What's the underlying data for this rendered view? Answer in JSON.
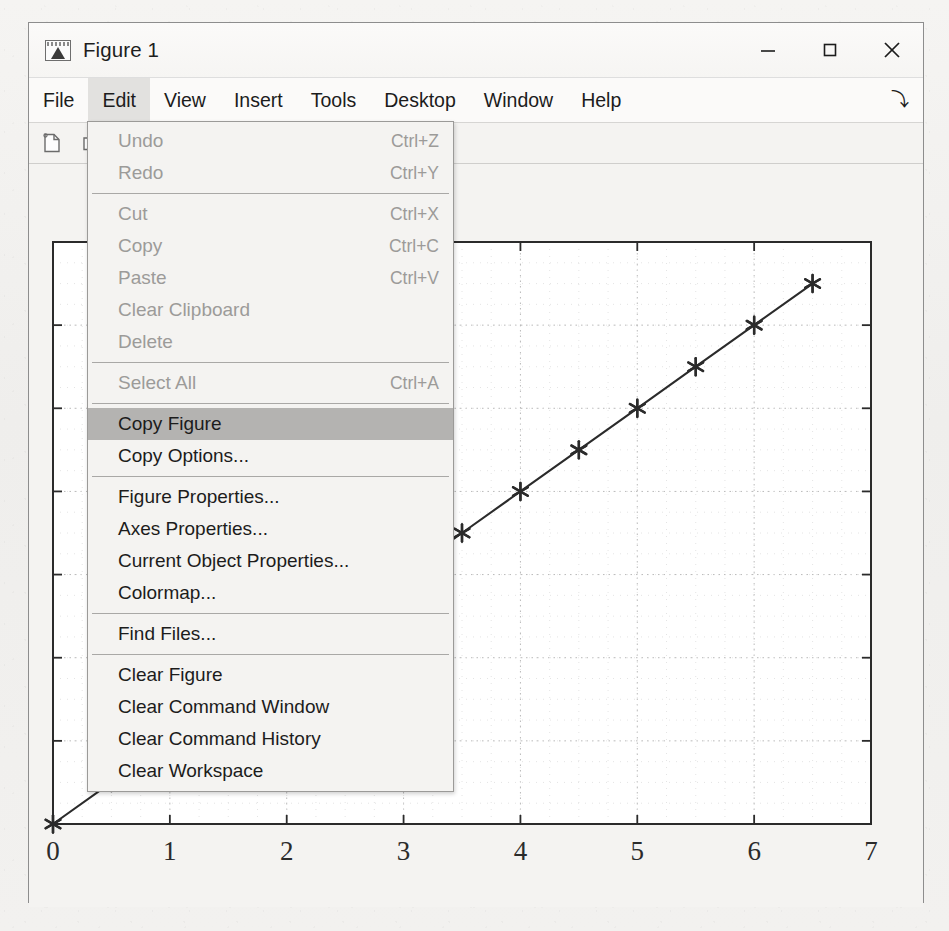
{
  "window": {
    "title": "Figure 1",
    "app_icon": "matlab-figure-icon",
    "controls": {
      "minimize_label": "–",
      "maximize_label": "□",
      "close_label": "✕"
    }
  },
  "menubar": {
    "items": [
      {
        "label": "File",
        "active": false
      },
      {
        "label": "Edit",
        "active": true
      },
      {
        "label": "View",
        "active": false
      },
      {
        "label": "Insert",
        "active": false
      },
      {
        "label": "Tools",
        "active": false
      },
      {
        "label": "Desktop",
        "active": false
      },
      {
        "label": "Window",
        "active": false
      },
      {
        "label": "Help",
        "active": false
      }
    ],
    "overflow_glyph": "⤵"
  },
  "toolbar": {
    "buttons": [
      {
        "icon": "new-figure-icon",
        "label": "New Figure"
      },
      {
        "icon": "open-file-icon",
        "label": "Open File"
      }
    ]
  },
  "edit_menu": {
    "rows": [
      {
        "type": "item",
        "label": "Undo",
        "accel": "Ctrl+Z",
        "disabled": true,
        "highlight": false
      },
      {
        "type": "item",
        "label": "Redo",
        "accel": "Ctrl+Y",
        "disabled": true,
        "highlight": false
      },
      {
        "type": "separator"
      },
      {
        "type": "item",
        "label": "Cut",
        "accel": "Ctrl+X",
        "disabled": true,
        "highlight": false
      },
      {
        "type": "item",
        "label": "Copy",
        "accel": "Ctrl+C",
        "disabled": true,
        "highlight": false
      },
      {
        "type": "item",
        "label": "Paste",
        "accel": "Ctrl+V",
        "disabled": true,
        "highlight": false
      },
      {
        "type": "item",
        "label": "Clear Clipboard",
        "accel": "",
        "disabled": true,
        "highlight": false
      },
      {
        "type": "item",
        "label": "Delete",
        "accel": "",
        "disabled": true,
        "highlight": false
      },
      {
        "type": "separator"
      },
      {
        "type": "item",
        "label": "Select All",
        "accel": "Ctrl+A",
        "disabled": true,
        "highlight": false
      },
      {
        "type": "separator"
      },
      {
        "type": "item",
        "label": "Copy Figure",
        "accel": "",
        "disabled": false,
        "highlight": true
      },
      {
        "type": "item",
        "label": "Copy Options...",
        "accel": "",
        "disabled": false,
        "highlight": false
      },
      {
        "type": "separator"
      },
      {
        "type": "item",
        "label": "Figure Properties...",
        "accel": "",
        "disabled": false,
        "highlight": false
      },
      {
        "type": "item",
        "label": "Axes Properties...",
        "accel": "",
        "disabled": false,
        "highlight": false
      },
      {
        "type": "item",
        "label": "Current Object Properties...",
        "accel": "",
        "disabled": false,
        "highlight": false
      },
      {
        "type": "item",
        "label": "Colormap...",
        "accel": "",
        "disabled": false,
        "highlight": false
      },
      {
        "type": "separator"
      },
      {
        "type": "item",
        "label": "Find Files...",
        "accel": "",
        "disabled": false,
        "highlight": false
      },
      {
        "type": "separator"
      },
      {
        "type": "item",
        "label": "Clear Figure",
        "accel": "",
        "disabled": false,
        "highlight": false
      },
      {
        "type": "item",
        "label": "Clear Command Window",
        "accel": "",
        "disabled": false,
        "highlight": false
      },
      {
        "type": "item",
        "label": "Clear Command History",
        "accel": "",
        "disabled": false,
        "highlight": false
      },
      {
        "type": "item",
        "label": "Clear Workspace",
        "accel": "",
        "disabled": false,
        "highlight": false
      }
    ]
  },
  "chart_data": {
    "type": "line",
    "title": "",
    "xlabel": "",
    "ylabel": "",
    "xlim": [
      0,
      7
    ],
    "ylim": [
      0,
      7
    ],
    "xticks": [
      0,
      1,
      2,
      3,
      4,
      5,
      6,
      7
    ],
    "xticklabels": [
      "0",
      "1",
      "2",
      "3",
      "4",
      "5",
      "6",
      "7"
    ],
    "yticks": [
      0,
      1,
      2,
      3,
      4,
      5,
      6,
      7
    ],
    "yticklabels": [
      "",
      "",
      "",
      "",
      "",
      "",
      "",
      ""
    ],
    "grid": true,
    "grid_style": "dotted",
    "legend": null,
    "series": [
      {
        "name": "line1",
        "marker": "*",
        "linestyle": "-",
        "color": "#2b2b2b",
        "x": [
          0,
          0.5,
          1,
          1.5,
          2,
          2.5,
          3,
          3.5,
          4,
          4.5,
          5,
          5.5,
          6,
          6.5
        ],
        "y": [
          0,
          0.5,
          1,
          1.5,
          2,
          2.5,
          3,
          3.5,
          4,
          4.5,
          5,
          5.5,
          6,
          6.5
        ]
      }
    ]
  },
  "colors": {
    "window_bg": "#f7f6f4",
    "canvas_bg": "#f4f3f1",
    "plot_bg": "#ffffff",
    "axis": "#2b2b2b",
    "menu_highlight": "#b4b3b1",
    "disabled_text": "#9c9b99"
  }
}
